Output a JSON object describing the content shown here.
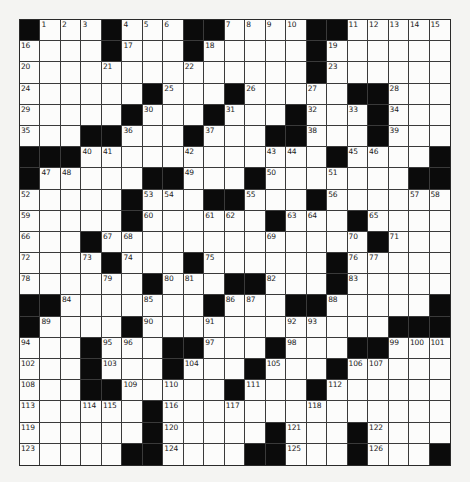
{
  "puzzle": {
    "rows": 21,
    "cols": 21,
    "colors": {
      "black_cell": "#0b0b0b",
      "white_cell": "#fcfcfb",
      "grid_line": "#3a3a3a",
      "background": "#f4f4f2"
    },
    "black_cells": [
      [
        0,
        4,
        8,
        9,
        14,
        15
      ],
      [
        4,
        8,
        14
      ],
      [
        14
      ],
      [
        6,
        10,
        16,
        17
      ],
      [
        5,
        9,
        13,
        17
      ],
      [
        3,
        4,
        8,
        12,
        13,
        17
      ],
      [
        0,
        1,
        2,
        15,
        20
      ],
      [
        0,
        6,
        7,
        11,
        19,
        20
      ],
      [
        5,
        9,
        10,
        14
      ],
      [
        5,
        12,
        16
      ],
      [
        3,
        17
      ],
      [
        4,
        8,
        15
      ],
      [
        6,
        10,
        11,
        15
      ],
      [
        0,
        1,
        9,
        13,
        14,
        20
      ],
      [
        0,
        5,
        18,
        19,
        20
      ],
      [
        3,
        7,
        8,
        12,
        16,
        17
      ],
      [
        3,
        7,
        11,
        15
      ],
      [
        3,
        4,
        10,
        14
      ],
      [
        6
      ],
      [
        6,
        12,
        16
      ],
      [
        5,
        6,
        11,
        12,
        16,
        20
      ]
    ],
    "numbers": [
      {
        "1": 1,
        "2": 2,
        "3": 3,
        "5": 4,
        "6": 5,
        "7": 6,
        "10": 7,
        "11": 8,
        "12": 9,
        "13": 10,
        "16": 11,
        "17": 12,
        "18": 13,
        "19": 14,
        "20": 15
      },
      {
        "0": 16,
        "5": 17,
        "9": 18,
        "15": 19
      },
      {
        "0": 20,
        "4": 21,
        "8": 22,
        "15": 23
      },
      {
        "0": 24,
        "7": 25,
        "11": 26,
        "14": 27,
        "18": 28
      },
      {
        "0": 29,
        "6": 30,
        "10": 31,
        "14": 32,
        "16": 33,
        "18": 34
      },
      {
        "0": 35,
        "5": 36,
        "9": 37,
        "14": 38,
        "18": 39
      },
      {
        "3": 40,
        "4": 41,
        "8": 42,
        "12": 43,
        "13": 44,
        "16": 45,
        "17": 46
      },
      {
        "1": 47,
        "2": 48,
        "8": 49,
        "12": 50,
        "15": 51
      },
      {
        "0": 52,
        "6": 53,
        "7": 54,
        "11": 55,
        "15": 56,
        "19": 57,
        "20": 58
      },
      {
        "0": 59,
        "6": 60,
        "9": 61,
        "10": 62,
        "13": 63,
        "14": 64,
        "17": 65
      },
      {
        "0": 66,
        "4": 67,
        "5": 68,
        "12": 69,
        "16": 70,
        "18": 71
      },
      {
        "0": 72,
        "3": 73,
        "5": 74,
        "9": 75,
        "16": 76,
        "17": 77
      },
      {
        "0": 78,
        "4": 79,
        "7": 80,
        "8": 81,
        "12": 82,
        "16": 83
      },
      {
        "2": 84,
        "6": 85,
        "10": 86,
        "11": 87,
        "15": 88
      },
      {
        "1": 89,
        "6": 90,
        "9": 91,
        "13": 92,
        "14": 93
      },
      {
        "0": 94,
        "4": 95,
        "5": 96,
        "9": 97,
        "13": 98,
        "18": 99,
        "19": 100,
        "20": 101
      },
      {
        "0": 102,
        "4": 103,
        "8": 104,
        "12": 105,
        "16": 106,
        "17": 107
      },
      {
        "0": 108,
        "5": 109,
        "7": 110,
        "11": 111,
        "15": 112
      },
      {
        "0": 113,
        "3": 114,
        "4": 115,
        "7": 116,
        "10": 117,
        "14": 118
      },
      {
        "0": 119,
        "7": 120,
        "13": 121,
        "17": 122
      },
      {
        "0": 123,
        "7": 124,
        "13": 125,
        "17": 126
      }
    ]
  }
}
